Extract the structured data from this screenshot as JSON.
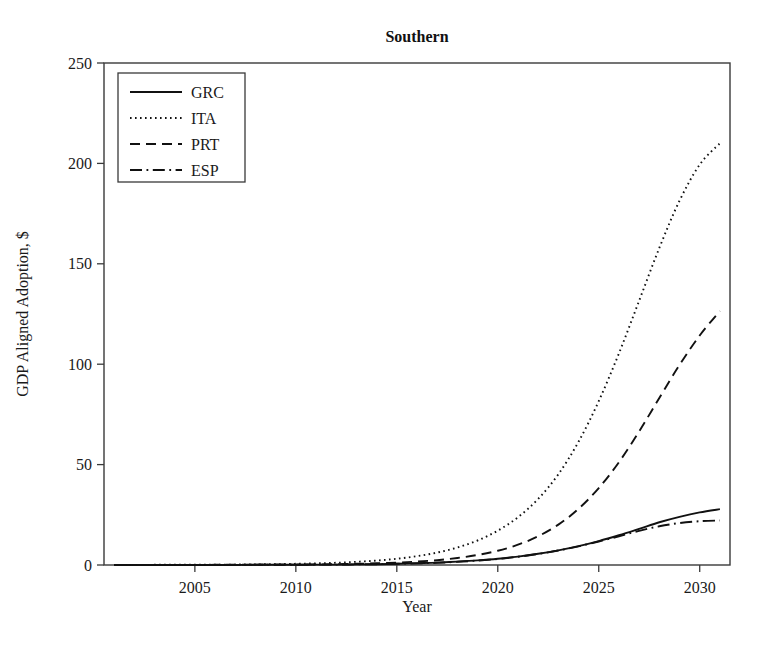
{
  "chart_data": {
    "type": "line",
    "title": "Southern",
    "xlabel": "Year",
    "ylabel": "GDP Aligned Adoption, $",
    "xlim": [
      2000.5,
      2031.5
    ],
    "ylim": [
      0,
      250
    ],
    "xticks": [
      2005,
      2010,
      2015,
      2020,
      2025,
      2030
    ],
    "xtick_labels": [
      "2005",
      "2010",
      "2015",
      "2020",
      "2025",
      "2030"
    ],
    "yticks": [
      0,
      50,
      100,
      150,
      200,
      250
    ],
    "ytick_labels": [
      "0",
      "50",
      "100",
      "150",
      "200",
      "250"
    ],
    "grid": false,
    "legend_position": "upper left",
    "x": [
      2001,
      2002,
      2003,
      2004,
      2005,
      2006,
      2007,
      2008,
      2009,
      2010,
      2011,
      2012,
      2013,
      2014,
      2015,
      2016,
      2017,
      2018,
      2019,
      2020,
      2021,
      2022,
      2023,
      2024,
      2025,
      2026,
      2027,
      2028,
      2029,
      2030,
      2031
    ],
    "series": [
      {
        "name": "GRC",
        "linestyle": "solid",
        "color": "#111111",
        "values": [
          0.0,
          0.0,
          0.0,
          0.0,
          0.0,
          0.0,
          0.0,
          0.1,
          0.1,
          0.1,
          0.2,
          0.2,
          0.3,
          0.4,
          0.6,
          0.9,
          1.2,
          1.7,
          2.3,
          3.1,
          4.2,
          5.6,
          7.3,
          9.4,
          11.9,
          14.8,
          18.0,
          21.3,
          24.0,
          26.2,
          27.8
        ]
      },
      {
        "name": "ITA",
        "linestyle": "dotted",
        "color": "#111111",
        "values": [
          0.0,
          0.0,
          0.1,
          0.1,
          0.1,
          0.2,
          0.2,
          0.3,
          0.4,
          0.6,
          0.8,
          1.1,
          1.6,
          2.2,
          3.1,
          4.4,
          6.2,
          8.7,
          12.2,
          17.1,
          23.8,
          32.9,
          45.2,
          61.4,
          81.6,
          105.4,
          131.6,
          157.9,
          181.4,
          199.4,
          210.0
        ]
      },
      {
        "name": "PRT",
        "linestyle": "dashed",
        "color": "#111111",
        "values": [
          0.0,
          0.0,
          0.0,
          0.0,
          0.0,
          0.1,
          0.1,
          0.1,
          0.2,
          0.2,
          0.3,
          0.4,
          0.6,
          0.9,
          1.2,
          1.7,
          2.4,
          3.5,
          5.0,
          7.1,
          10.1,
          14.3,
          20.1,
          28.0,
          38.3,
          51.2,
          66.5,
          83.2,
          99.6,
          114.3,
          126.5
        ]
      },
      {
        "name": "ESP",
        "linestyle": "dashdot",
        "color": "#111111",
        "values": [
          0.0,
          0.0,
          0.0,
          0.0,
          0.0,
          0.0,
          0.0,
          0.1,
          0.1,
          0.1,
          0.2,
          0.2,
          0.3,
          0.4,
          0.6,
          0.8,
          1.1,
          1.6,
          2.2,
          3.0,
          4.1,
          5.5,
          7.2,
          9.3,
          11.7,
          14.3,
          17.0,
          19.3,
          20.9,
          21.8,
          22.2
        ]
      }
    ]
  },
  "legend": {
    "entries": [
      {
        "label": "GRC"
      },
      {
        "label": "ITA"
      },
      {
        "label": "PRT"
      },
      {
        "label": "ESP"
      }
    ]
  }
}
